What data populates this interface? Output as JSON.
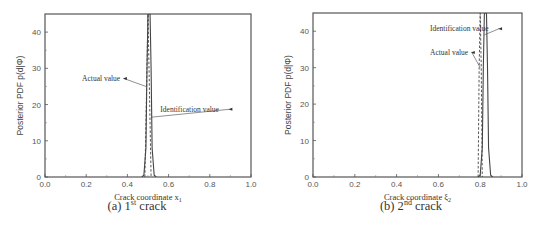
{
  "chart_data": [
    {
      "type": "line",
      "panel": "a",
      "caption_prefix": "(a) 1",
      "caption_sup": "st",
      "caption_suffix": " crack",
      "xlabel": "Crack coordinate x",
      "xlabel_sub": "1",
      "ylabel": "Posterior PDF p(d|Φ)",
      "xlim": [
        0.0,
        1.0
      ],
      "ylim": [
        0,
        45
      ],
      "xticks": [
        "0.0",
        "0.2",
        "0.4",
        "0.6",
        "0.8",
        "1.0"
      ],
      "xtick_values": [
        0.0,
        0.2,
        0.4,
        0.6,
        0.8,
        1.0
      ],
      "yticks": [
        "0",
        "10",
        "20",
        "30",
        "40"
      ],
      "ytick_values": [
        0,
        10,
        20,
        30,
        40
      ],
      "grid": false,
      "series": [
        {
          "name": "Identification value",
          "style": "solid",
          "x": [
            0.47,
            0.48,
            0.49,
            0.495,
            0.5,
            0.505,
            0.51,
            0.515,
            0.52,
            0.53,
            0.54
          ],
          "y": [
            0,
            0.5,
            8,
            30,
            45,
            45,
            45,
            30,
            8,
            0.5,
            0
          ]
        },
        {
          "name": "Actual value",
          "style": "dashed",
          "x": [
            0.485,
            0.495,
            0.5,
            0.505,
            0.515
          ],
          "y": [
            0,
            30,
            45,
            30,
            0
          ]
        }
      ],
      "annotations": [
        {
          "text": "Actual value",
          "text_x": 0.18,
          "text_y": 26.5,
          "arrow_to_x": 0.49,
          "arrow_to_y": 25
        },
        {
          "text": "Identification value",
          "text_x": 0.56,
          "text_y": 18,
          "arrow_to_x": 0.515,
          "arrow_to_y": 16.5
        }
      ]
    },
    {
      "type": "line",
      "panel": "b",
      "caption_prefix": "(b) 2",
      "caption_sup": "nd",
      "caption_suffix": " crack",
      "xlabel": "Crack coordinate ξ",
      "xlabel_sub": "2",
      "ylabel": "Posterior PDF p(d|Φ)",
      "xlim": [
        0.0,
        1.0
      ],
      "ylim": [
        0,
        45
      ],
      "xticks": [
        "0.0",
        "0.2",
        "0.4",
        "0.6",
        "0.8",
        "1.0"
      ],
      "xtick_values": [
        0.0,
        0.2,
        0.4,
        0.6,
        0.8,
        1.0
      ],
      "yticks": [
        "0",
        "10",
        "20",
        "30",
        "40"
      ],
      "ytick_values": [
        0,
        10,
        20,
        30,
        40
      ],
      "grid": false,
      "series": [
        {
          "name": "Identification value",
          "style": "solid",
          "x": [
            0.79,
            0.8,
            0.81,
            0.815,
            0.82,
            0.825,
            0.83,
            0.835,
            0.84,
            0.85,
            0.86
          ],
          "y": [
            0,
            0.5,
            8,
            30,
            45,
            45,
            45,
            30,
            8,
            0.5,
            0
          ]
        },
        {
          "name": "Actual value",
          "style": "dashed",
          "x": [
            0.79,
            0.795,
            0.8,
            0.805,
            0.81
          ],
          "y": [
            0,
            30,
            45,
            30,
            0
          ]
        }
      ],
      "annotations": [
        {
          "text": "Identification value",
          "text_x": 0.56,
          "text_y": 40,
          "arrow_to_x": 0.82,
          "arrow_to_y": 39
        },
        {
          "text": "Actual value",
          "text_x": 0.56,
          "text_y": 33.5,
          "arrow_to_x": 0.8,
          "arrow_to_y": 30
        }
      ]
    }
  ]
}
